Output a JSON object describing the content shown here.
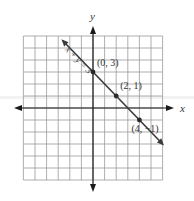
{
  "chart_data": {
    "type": "line",
    "title": "",
    "xlabel": "x",
    "ylabel": "y",
    "xlim": [
      -6,
      6
    ],
    "ylim": [
      -6,
      6
    ],
    "grid": true,
    "grid_step": 1,
    "series": [
      {
        "name": "x + y = 3",
        "equation": "x + y = 3",
        "slope": -1,
        "intercept": 3,
        "x_range": [
          -2.6,
          6
        ],
        "color": "#3a3a3a"
      }
    ],
    "points": [
      {
        "x": 0,
        "y": 3,
        "label": "(0, 3)"
      },
      {
        "x": 2,
        "y": 1,
        "label": "(2, 1)"
      },
      {
        "x": 4,
        "y": -1,
        "label": "(4, −1)"
      }
    ],
    "annotations": [
      {
        "text": "x + y = 3",
        "placement": "along-line-upper-left"
      }
    ]
  }
}
